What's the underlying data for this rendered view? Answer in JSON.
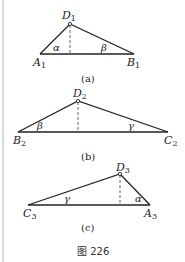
{
  "figure": {
    "caption": "图 226",
    "panels": [
      {
        "id": "a",
        "label": "(a)",
        "vertices": {
          "left": {
            "name": "A",
            "sub": "1"
          },
          "top": {
            "name": "D",
            "sub": "1"
          },
          "right": {
            "name": "B",
            "sub": "1"
          }
        },
        "angles": {
          "left": "α",
          "right": "β"
        }
      },
      {
        "id": "b",
        "label": "(b)",
        "vertices": {
          "left": {
            "name": "B",
            "sub": "2"
          },
          "top": {
            "name": "D",
            "sub": "2"
          },
          "right": {
            "name": "C",
            "sub": "2"
          }
        },
        "angles": {
          "left": "β",
          "right": "γ"
        }
      },
      {
        "id": "c",
        "label": "(c)",
        "vertices": {
          "left": {
            "name": "C",
            "sub": "3"
          },
          "top": {
            "name": "D",
            "sub": "3"
          },
          "right": {
            "name": "A",
            "sub": "3"
          }
        },
        "angles": {
          "left": "γ",
          "right": "α"
        }
      }
    ]
  }
}
